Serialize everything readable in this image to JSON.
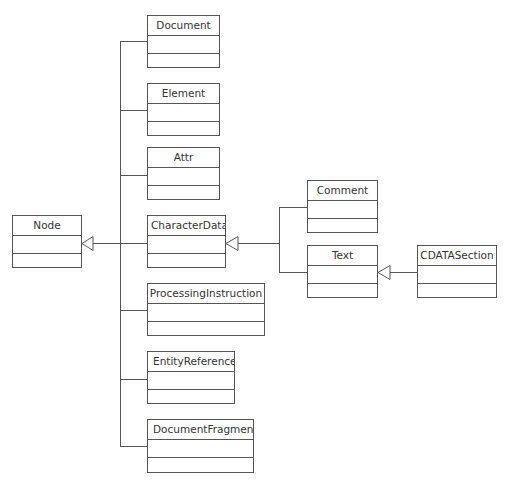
{
  "diagram": {
    "type": "UML class diagram",
    "line_color": "#555555",
    "classes": [
      {
        "id": "node",
        "name": "Node",
        "x": 12,
        "y": 215,
        "w": 70,
        "h": 53
      },
      {
        "id": "document",
        "name": "Document",
        "x": 147,
        "y": 15,
        "w": 73,
        "h": 53
      },
      {
        "id": "element",
        "name": "Element",
        "x": 147,
        "y": 83,
        "w": 73,
        "h": 53
      },
      {
        "id": "attr",
        "name": "Attr",
        "x": 147,
        "y": 147,
        "w": 73,
        "h": 53
      },
      {
        "id": "characterdata",
        "name": "CharacterData",
        "x": 147,
        "y": 215,
        "w": 79,
        "h": 53
      },
      {
        "id": "processinginstruction",
        "name": "ProcessingInstruction",
        "x": 147,
        "y": 283,
        "w": 118,
        "h": 53
      },
      {
        "id": "entityreference",
        "name": "EntityReference",
        "x": 147,
        "y": 351,
        "w": 88,
        "h": 53
      },
      {
        "id": "documentfragment",
        "name": "DocumentFragment",
        "x": 147,
        "y": 419,
        "w": 107,
        "h": 54
      },
      {
        "id": "comment",
        "name": "Comment",
        "x": 307,
        "y": 180,
        "w": 71,
        "h": 53
      },
      {
        "id": "text",
        "name": "Text",
        "x": 307,
        "y": 245,
        "w": 71,
        "h": 53
      },
      {
        "id": "cdatasection",
        "name": "CDATASection",
        "x": 417,
        "y": 245,
        "w": 80,
        "h": 53
      }
    ],
    "generalizations": [
      {
        "child": "Document",
        "parent": "Node"
      },
      {
        "child": "Element",
        "parent": "Node"
      },
      {
        "child": "Attr",
        "parent": "Node"
      },
      {
        "child": "CharacterData",
        "parent": "Node"
      },
      {
        "child": "ProcessingInstruction",
        "parent": "Node"
      },
      {
        "child": "EntityReference",
        "parent": "Node"
      },
      {
        "child": "DocumentFragment",
        "parent": "Node"
      },
      {
        "child": "Comment",
        "parent": "CharacterData"
      },
      {
        "child": "Text",
        "parent": "CharacterData"
      },
      {
        "child": "CDATASection",
        "parent": "Text"
      }
    ]
  }
}
